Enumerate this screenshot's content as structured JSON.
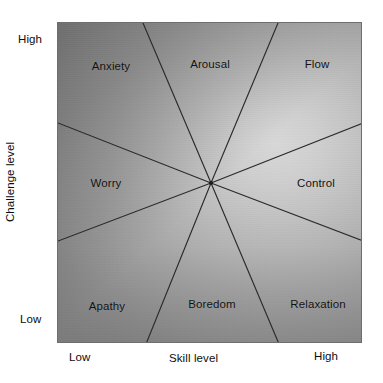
{
  "diagram": {
    "name": "flow-model-challenge-skill-diagram",
    "axes": {
      "y": {
        "title": "Challenge level",
        "high_label": "High",
        "low_label": "Low"
      },
      "x": {
        "title": "Skill level",
        "low_label": "Low",
        "high_label": "High"
      }
    },
    "colors": {
      "line": "#2b2b2b",
      "border": "#6e6e6e",
      "text": "#111111",
      "fill_dark": "#868686",
      "fill_light": "#d8d8d8"
    },
    "center": {
      "x": 210,
      "y": 182
    },
    "sectors": [
      {
        "id": "anxiety",
        "label": "Anxiety",
        "label_x": 110,
        "label_y": 65,
        "channel": "high-challenge-low-skill"
      },
      {
        "id": "arousal",
        "label": "Arousal",
        "label_x": 209,
        "label_y": 63,
        "channel": "high-challenge-mid-skill"
      },
      {
        "id": "flow",
        "label": "Flow",
        "label_x": 316,
        "label_y": 63,
        "channel": "high-challenge-high-skill"
      },
      {
        "id": "control",
        "label": "Control",
        "label_x": 315,
        "label_y": 182,
        "channel": "mid-challenge-high-skill"
      },
      {
        "id": "relaxation",
        "label": "Relaxation",
        "label_x": 317,
        "label_y": 303,
        "channel": "low-challenge-high-skill"
      },
      {
        "id": "boredom",
        "label": "Boredom",
        "label_x": 211,
        "label_y": 303,
        "channel": "low-challenge-mid-skill"
      },
      {
        "id": "apathy",
        "label": "Apathy",
        "label_x": 106,
        "label_y": 305,
        "channel": "low-challenge-low-skill"
      },
      {
        "id": "worry",
        "label": "Worry",
        "label_x": 105,
        "label_y": 182,
        "channel": "mid-challenge-low-skill"
      }
    ],
    "divider_lines": [
      {
        "id": "anxiety-arousal-divider",
        "x1": 210,
        "y1": 182,
        "x2": 142,
        "y2": 22
      },
      {
        "id": "arousal-flow-divider",
        "x1": 210,
        "y1": 182,
        "x2": 277,
        "y2": 22
      },
      {
        "id": "flow-control-divider",
        "x1": 210,
        "y1": 182,
        "x2": 362,
        "y2": 122
      },
      {
        "id": "control-relaxation-divider",
        "x1": 210,
        "y1": 182,
        "x2": 362,
        "y2": 240
      },
      {
        "id": "relaxation-boredom-divider",
        "x1": 210,
        "y1": 182,
        "x2": 278,
        "y2": 343
      },
      {
        "id": "boredom-apathy-divider",
        "x1": 210,
        "y1": 182,
        "x2": 145,
        "y2": 343
      },
      {
        "id": "apathy-worry-divider",
        "x1": 210,
        "y1": 182,
        "x2": 57,
        "y2": 240
      },
      {
        "id": "worry-anxiety-divider",
        "x1": 210,
        "y1": 182,
        "x2": 57,
        "y2": 122
      }
    ]
  }
}
